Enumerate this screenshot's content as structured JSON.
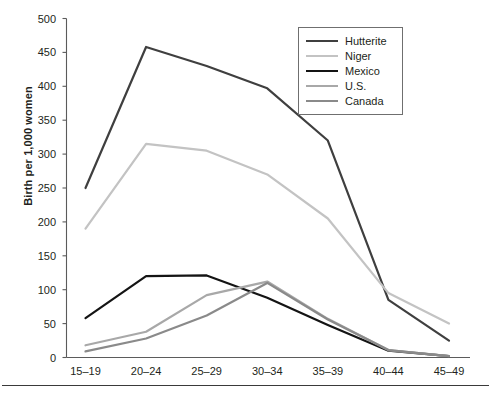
{
  "chart_data": {
    "type": "line",
    "title": "",
    "subtitle": "",
    "xlabel": "",
    "ylabel": "Birth per 1,000 women",
    "categories": [
      "15–19",
      "20–24",
      "25–29",
      "30–34",
      "35–39",
      "40–44",
      "45–49"
    ],
    "ylim": [
      0,
      500
    ],
    "yticks": [
      0,
      50,
      100,
      150,
      200,
      250,
      300,
      350,
      400,
      450,
      500
    ],
    "ytick_labels": [
      "0",
      "50",
      "100",
      "150",
      "200",
      "250",
      "300",
      "350",
      "400",
      "450",
      "500"
    ],
    "grid": false,
    "legend_position": "top-right",
    "series": [
      {
        "name": "Hutterite",
        "color": "#3f3f3f",
        "width": 2.2,
        "values": [
          250,
          458,
          430,
          397,
          320,
          85,
          25
        ]
      },
      {
        "name": "Niger",
        "color": "#c3c3c3",
        "width": 2.2,
        "values": [
          190,
          315,
          305,
          270,
          205,
          95,
          50
        ]
      },
      {
        "name": "Mexico",
        "color": "#141414",
        "width": 2.2,
        "values": [
          58,
          120,
          121,
          88,
          48,
          10,
          2
        ]
      },
      {
        "name": "U.S.",
        "color": "#a8a8a8",
        "width": 2.2,
        "values": [
          18,
          38,
          92,
          112,
          57,
          11,
          2
        ]
      },
      {
        "name": "Canada",
        "color": "#8a8a8a",
        "width": 2.2,
        "values": [
          9,
          28,
          62,
          110,
          56,
          11,
          2
        ]
      }
    ]
  },
  "legend": {
    "items": [
      {
        "label": "Hutterite"
      },
      {
        "label": "Niger"
      },
      {
        "label": "Mexico"
      },
      {
        "label": "U.S."
      },
      {
        "label": "Canada"
      }
    ]
  },
  "axes": {
    "y_axis_title": "Birth per 1,000 women"
  }
}
